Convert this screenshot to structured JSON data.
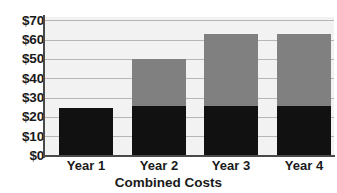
{
  "chart_data": {
    "type": "bar",
    "title": "",
    "xlabel": "Combined Costs",
    "ylabel": "",
    "categories": [
      "Year 1",
      "Year 2",
      "Year 3",
      "Year 4"
    ],
    "series": [
      {
        "name": "Lower segment",
        "color": "#111111",
        "values": [
          25,
          26,
          26,
          26
        ]
      },
      {
        "name": "Upper segment",
        "color": "#808080",
        "values": [
          0,
          24,
          37,
          37
        ]
      }
    ],
    "totals": [
      25,
      50,
      63,
      63
    ],
    "stacked": true,
    "ylim": [
      0,
      72
    ],
    "ytick_values": [
      0,
      10,
      20,
      30,
      40,
      50,
      60,
      70
    ],
    "ytick_labels": [
      "$0",
      "$10",
      "$20",
      "$30",
      "$40",
      "$50",
      "$60",
      "$70"
    ],
    "grid": true,
    "legend": "none",
    "plot_background": "#f2f2f2",
    "axis_color": "#4a4a4a",
    "gridline_color": "#b6b6b6"
  },
  "axis_title": "Combined Costs"
}
